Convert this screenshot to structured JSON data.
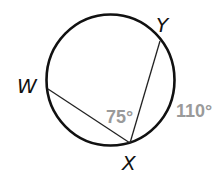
{
  "diagram": {
    "type": "inscribed-angle-circle",
    "points": {
      "W": {
        "label": "W"
      },
      "X": {
        "label": "X"
      },
      "Y": {
        "label": "Y"
      }
    },
    "angle_label": "75°",
    "arc_label": "110°",
    "colors": {
      "stroke": "#111111",
      "measure_text": "#9a9a9a"
    }
  }
}
